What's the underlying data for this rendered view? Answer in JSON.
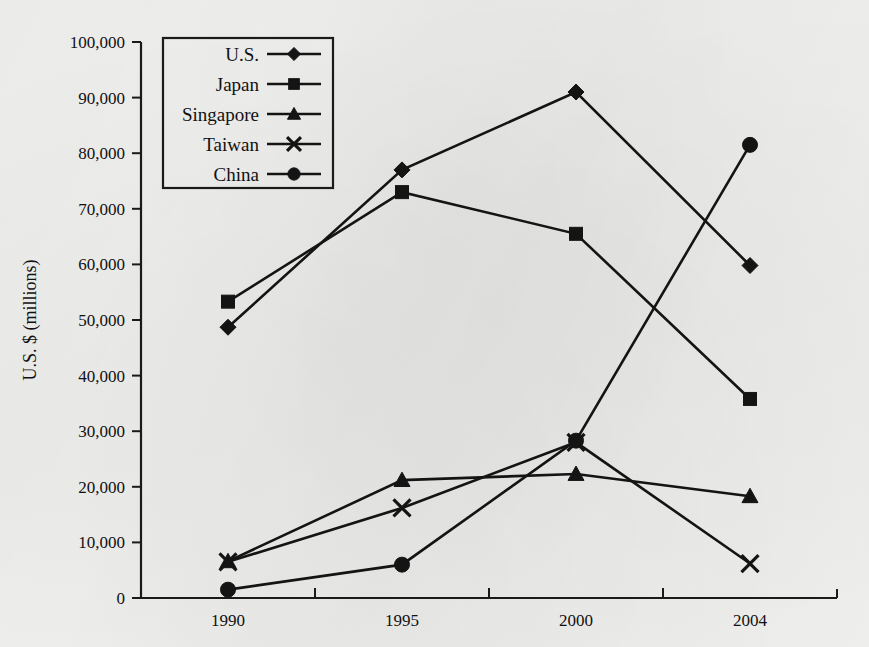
{
  "chart_data": {
    "type": "line",
    "title": "",
    "xlabel": "",
    "ylabel": "U.S. $ (millions)",
    "categories": [
      "1990",
      "1995",
      "2000",
      "2004"
    ],
    "ylim": [
      0,
      100000
    ],
    "ytick_step": 10000,
    "ytick_labels": [
      "0",
      "10,000",
      "20,000",
      "30,000",
      "40,000",
      "50,000",
      "60,000",
      "70,000",
      "80,000",
      "90,000",
      "100,000"
    ],
    "ytick_values": [
      0,
      10000,
      20000,
      30000,
      40000,
      50000,
      60000,
      70000,
      80000,
      90000,
      100000
    ],
    "grid": false,
    "legend_position": "upper-left-inside",
    "series": [
      {
        "name": "U.S.",
        "marker": "diamond",
        "values": [
          48700,
          77000,
          91000,
          59800
        ]
      },
      {
        "name": "Japan",
        "marker": "square",
        "values": [
          53300,
          73000,
          65500,
          35800
        ]
      },
      {
        "name": "Singapore",
        "marker": "triangle",
        "values": [
          6600,
          21200,
          22300,
          18300
        ]
      },
      {
        "name": "Taiwan",
        "marker": "x",
        "values": [
          6500,
          16200,
          28000,
          6200
        ]
      },
      {
        "name": "China",
        "marker": "circle",
        "values": [
          1500,
          6000,
          28300,
          81500
        ]
      }
    ]
  },
  "colors": {
    "ink": "#141414",
    "axis": "#1b1b1b",
    "background": "#f3f3f1"
  }
}
